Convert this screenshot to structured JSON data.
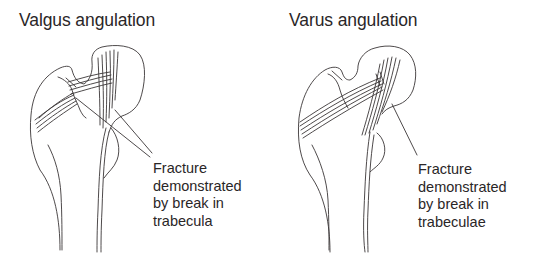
{
  "figure": {
    "panels": [
      {
        "title": "Valgus angulation",
        "label_lines": [
          "Fracture",
          "demonstrated",
          "by break in",
          "trabecula"
        ],
        "illustration": "proximal-femur-valgus"
      },
      {
        "title": "Varus angulation",
        "label_lines": [
          "Fracture",
          "demonstrated",
          "by break in",
          "trabeculae"
        ],
        "illustration": "proximal-femur-varus"
      }
    ],
    "line_color": "#3a3637",
    "text_color": "#2a2627",
    "background": "#ffffff"
  }
}
